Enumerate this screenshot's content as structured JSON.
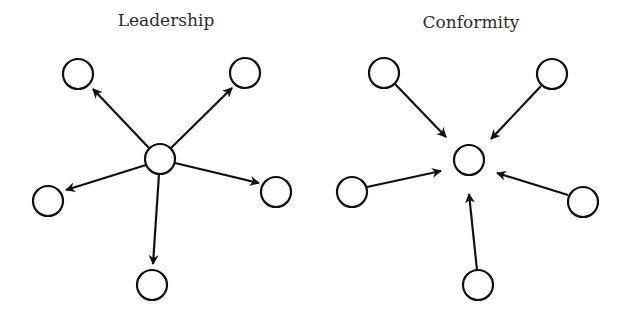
{
  "panels": [
    {
      "id": "leadership",
      "title": "Leadership",
      "title_x": 166,
      "title_y": 26,
      "direction": "outward",
      "center_node": {
        "x": 160,
        "y": 159,
        "r": 15
      },
      "peer_nodes": [
        {
          "x": 78,
          "y": 74,
          "r": 15
        },
        {
          "x": 245,
          "y": 73,
          "r": 15
        },
        {
          "x": 48,
          "y": 201,
          "r": 15
        },
        {
          "x": 276,
          "y": 192,
          "r": 15
        },
        {
          "x": 152,
          "y": 285,
          "r": 15
        }
      ],
      "edges": [
        {
          "from": [
            149,
            148
          ],
          "to": [
            93,
            89
          ]
        },
        {
          "from": [
            171,
            148
          ],
          "to": [
            232,
            88
          ]
        },
        {
          "from": [
            146,
            165
          ],
          "to": [
            66,
            190
          ]
        },
        {
          "from": [
            175,
            163
          ],
          "to": [
            259,
            183
          ]
        },
        {
          "from": [
            159,
            174
          ],
          "to": [
            153,
            264
          ]
        }
      ]
    },
    {
      "id": "conformity",
      "title": "Conformity",
      "title_x": 471,
      "title_y": 28,
      "direction": "inward",
      "center_node": {
        "x": 469,
        "y": 160,
        "r": 15
      },
      "peer_nodes": [
        {
          "x": 384,
          "y": 73,
          "r": 15
        },
        {
          "x": 552,
          "y": 74,
          "r": 15
        },
        {
          "x": 352,
          "y": 192,
          "r": 15
        },
        {
          "x": 583,
          "y": 202,
          "r": 15
        },
        {
          "x": 478,
          "y": 285,
          "r": 15
        }
      ],
      "edges": [
        {
          "from": [
            395,
            84
          ],
          "to": [
            446,
            137
          ]
        },
        {
          "from": [
            541,
            86
          ],
          "to": [
            491,
            139
          ]
        },
        {
          "from": [
            367,
            187
          ],
          "to": [
            441,
            171
          ]
        },
        {
          "from": [
            568,
            195
          ],
          "to": [
            497,
            173
          ]
        },
        {
          "from": [
            477,
            270
          ],
          "to": [
            469,
            194
          ]
        }
      ]
    }
  ],
  "style": {
    "stroke_color": "#111111",
    "text_color": "#2b2b2b",
    "background": "#ffffff"
  }
}
